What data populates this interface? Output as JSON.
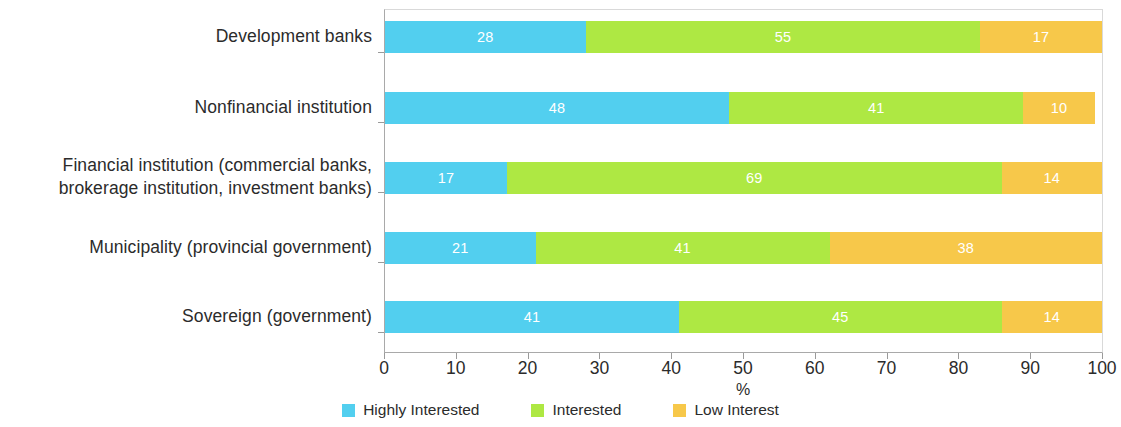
{
  "chart_data": {
    "type": "bar",
    "orientation": "horizontal",
    "stacked": true,
    "stack_total": 100,
    "title": "",
    "xlabel": "%",
    "ylabel": "",
    "xlim": [
      0,
      100
    ],
    "xticks": [
      "0",
      "10",
      "20",
      "30",
      "40",
      "50",
      "60",
      "70",
      "80",
      "90",
      "100"
    ],
    "grid": false,
    "legend_position": "bottom-center",
    "categories": [
      "Development banks",
      "Nonfinancial institution",
      "Financial institution (commercial banks, brokerage institution, investment banks)",
      "Municipality (provincial government)",
      "Sovereign (government)"
    ],
    "category_lines": [
      [
        "Development banks"
      ],
      [
        "Nonfinancial institution"
      ],
      [
        "Financial institution (commercial banks,",
        "brokerage institution, investment banks)"
      ],
      [
        "Municipality (provincial government)"
      ],
      [
        "Sovereign (government)"
      ]
    ],
    "series": [
      {
        "name": "Highly Interested",
        "color": "#52CFEF",
        "values": [
          28,
          48,
          17,
          21,
          41
        ]
      },
      {
        "name": "Interested",
        "color": "#AEE843",
        "values": [
          55,
          41,
          69,
          41,
          45
        ]
      },
      {
        "name": "Low Interest",
        "color": "#F7C84A",
        "values": [
          17,
          10,
          14,
          38,
          14
        ]
      }
    ]
  },
  "legend": {
    "items": [
      {
        "label": "Highly Interested",
        "color": "#52CFEF"
      },
      {
        "label": "Interested",
        "color": "#AEE843"
      },
      {
        "label": "Low Interest",
        "color": "#F7C84A"
      }
    ]
  }
}
